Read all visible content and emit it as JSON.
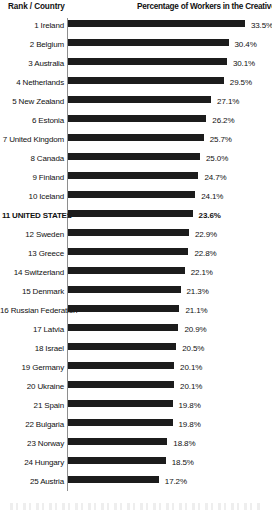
{
  "header": {
    "left_label": "Rank / Country",
    "right_label": "Percentage of Workers in the Creative Class"
  },
  "chart_data": {
    "type": "bar",
    "orientation": "horizontal",
    "title": "Percentage of Workers in the Creative Class",
    "xlabel": "Percentage of Workers in the Creative Class",
    "ylabel": "Rank / Country",
    "grid": false,
    "legend": "none",
    "xlim": [
      0,
      33.5
    ],
    "value_suffix": "%",
    "highlight_category": "11 UNITED STATES",
    "categories": [
      "1 Ireland",
      "2 Belgium",
      "3 Australia",
      "4 Netherlands",
      "5 New Zealand",
      "6 Estonia",
      "7 United Kingdom",
      "8 Canada",
      "9 Finland",
      "10 Iceland",
      "11 UNITED STATES",
      "12 Sweden",
      "13 Greece",
      "14 Switzerland",
      "15 Denmark",
      "16 Russian Federation",
      "17 Latvia",
      "18 Israel",
      "19 Germany",
      "20 Ukraine",
      "21 Spain",
      "22 Bulgaria",
      "23 Norway",
      "24 Hungary",
      "25 Austria"
    ],
    "values": [
      33.5,
      30.4,
      30.1,
      29.5,
      27.1,
      26.2,
      25.7,
      25.0,
      24.7,
      24.1,
      23.6,
      22.9,
      22.8,
      22.1,
      21.3,
      21.1,
      20.9,
      20.5,
      20.1,
      20.1,
      19.8,
      19.8,
      18.8,
      18.5,
      17.2
    ],
    "value_labels": [
      "33.5%",
      "30.4%",
      "30.1%",
      "29.5%",
      "27.1%",
      "26.2%",
      "25.7%",
      "25.0%",
      "24.7%",
      "24.1%",
      "23.6%",
      "22.9%",
      "22.8%",
      "22.1%",
      "21.3%",
      "21.1%",
      "20.9%",
      "20.5%",
      "20.1%",
      "20.1%",
      "19.8%",
      "19.8%",
      "18.8%",
      "18.5%",
      "17.2%"
    ],
    "rows": [
      {
        "rank": "1",
        "country": "Ireland",
        "label": "1 Ireland",
        "value": 33.5,
        "value_label": "33.5%",
        "highlight": false
      },
      {
        "rank": "2",
        "country": "Belgium",
        "label": "2 Belgium",
        "value": 30.4,
        "value_label": "30.4%",
        "highlight": false
      },
      {
        "rank": "3",
        "country": "Australia",
        "label": "3 Australia",
        "value": 30.1,
        "value_label": "30.1%",
        "highlight": false
      },
      {
        "rank": "4",
        "country": "Netherlands",
        "label": "4 Netherlands",
        "value": 29.5,
        "value_label": "29.5%",
        "highlight": false
      },
      {
        "rank": "5",
        "country": "New Zealand",
        "label": "5 New Zealand",
        "value": 27.1,
        "value_label": "27.1%",
        "highlight": false
      },
      {
        "rank": "6",
        "country": "Estonia",
        "label": "6 Estonia",
        "value": 26.2,
        "value_label": "26.2%",
        "highlight": false
      },
      {
        "rank": "7",
        "country": "United Kingdom",
        "label": "7 United Kingdom",
        "value": 25.7,
        "value_label": "25.7%",
        "highlight": false
      },
      {
        "rank": "8",
        "country": "Canada",
        "label": "8 Canada",
        "value": 25.0,
        "value_label": "25.0%",
        "highlight": false
      },
      {
        "rank": "9",
        "country": "Finland",
        "label": "9 Finland",
        "value": 24.7,
        "value_label": "24.7%",
        "highlight": false
      },
      {
        "rank": "10",
        "country": "Iceland",
        "label": "10 Iceland",
        "value": 24.1,
        "value_label": "24.1%",
        "highlight": false
      },
      {
        "rank": "11",
        "country": "UNITED STATES",
        "label": "11 UNITED STATES",
        "value": 23.6,
        "value_label": "23.6%",
        "highlight": true
      },
      {
        "rank": "12",
        "country": "Sweden",
        "label": "12 Sweden",
        "value": 22.9,
        "value_label": "22.9%",
        "highlight": false
      },
      {
        "rank": "13",
        "country": "Greece",
        "label": "13 Greece",
        "value": 22.8,
        "value_label": "22.8%",
        "highlight": false
      },
      {
        "rank": "14",
        "country": "Switzerland",
        "label": "14 Switzerland",
        "value": 22.1,
        "value_label": "22.1%",
        "highlight": false
      },
      {
        "rank": "15",
        "country": "Denmark",
        "label": "15 Denmark",
        "value": 21.3,
        "value_label": "21.3%",
        "highlight": false
      },
      {
        "rank": "16",
        "country": "Russian Federation",
        "label": "16 Russian Federation",
        "value": 21.1,
        "value_label": "21.1%",
        "highlight": false
      },
      {
        "rank": "17",
        "country": "Latvia",
        "label": "17 Latvia",
        "value": 20.9,
        "value_label": "20.9%",
        "highlight": false
      },
      {
        "rank": "18",
        "country": "Israel",
        "label": "18 Israel",
        "value": 20.5,
        "value_label": "20.5%",
        "highlight": false
      },
      {
        "rank": "19",
        "country": "Germany",
        "label": "19 Germany",
        "value": 20.1,
        "value_label": "20.1%",
        "highlight": false
      },
      {
        "rank": "20",
        "country": "Ukraine",
        "label": "20 Ukraine",
        "value": 20.1,
        "value_label": "20.1%",
        "highlight": false
      },
      {
        "rank": "21",
        "country": "Spain",
        "label": "21 Spain",
        "value": 19.8,
        "value_label": "19.8%",
        "highlight": false
      },
      {
        "rank": "22",
        "country": "Bulgaria",
        "label": "22 Bulgaria",
        "value": 19.8,
        "value_label": "19.8%",
        "highlight": false
      },
      {
        "rank": "23",
        "country": "Norway",
        "label": "23 Norway",
        "value": 18.8,
        "value_label": "18.8%",
        "highlight": false
      },
      {
        "rank": "24",
        "country": "Hungary",
        "label": "24 Hungary",
        "value": 18.5,
        "value_label": "18.5%",
        "highlight": false
      },
      {
        "rank": "25",
        "country": "Austria",
        "label": "25 Austria",
        "value": 17.2,
        "value_label": "17.2%",
        "highlight": false
      }
    ]
  },
  "colors": {
    "bar": "#1c1c1c",
    "axis": "#8e8e8e",
    "text": "#111111",
    "background": "#ffffff"
  }
}
